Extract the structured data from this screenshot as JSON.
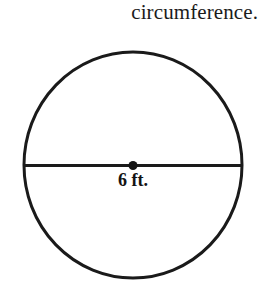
{
  "prompt": {
    "text": "circumference."
  },
  "figure": {
    "name": "circle-with-diameter",
    "shape": "circle",
    "stroke_color": "#1a1a1a",
    "fill_color": "#ffffff",
    "stroke_width_px": 3,
    "center_x_px": 133,
    "center_y_px": 165,
    "radius_x_px": 109,
    "radius_y_px": 113,
    "center_dot": {
      "name": "center-point",
      "diameter_px": 9,
      "color": "#141414"
    },
    "diameter_line": {
      "name": "diameter-segment",
      "x1_px": 24,
      "x2_px": 243,
      "y_px": 165,
      "color": "#1a1a1a",
      "width_px": 3
    },
    "diameter_label": "6 ft.",
    "diameter_value": 6,
    "diameter_units": "ft."
  }
}
